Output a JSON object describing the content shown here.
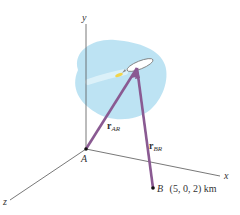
{
  "diagram": {
    "axes": {
      "x_label": "x",
      "y_label": "y",
      "z_label": "z"
    },
    "points": {
      "A": {
        "label": "A"
      },
      "B": {
        "label": "B",
        "coords": "(5, 0, 2) km"
      }
    },
    "vectors": [
      {
        "symbol": "r",
        "subscript": "AR"
      },
      {
        "symbol": "r",
        "subscript": "BR"
      }
    ],
    "colors": {
      "vector": "#8a5a92",
      "cloud": "#b9e1f2",
      "axis": "#555555",
      "rocket_flame": "#f2d44a"
    }
  }
}
